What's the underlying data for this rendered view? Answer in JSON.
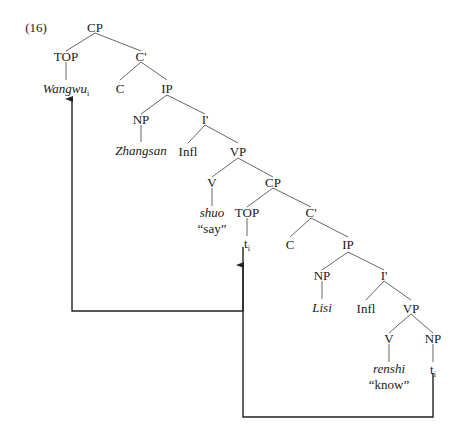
{
  "figure": {
    "example_number": "(16)",
    "stroke_color": "#555555",
    "text_color": "#1a1a1a",
    "arrow_color": "#222222",
    "background": "#ffffff"
  },
  "nodes": {
    "cp_matrix": "CP",
    "top_matrix": "TOP",
    "cbar_matrix": "C'",
    "wangwu": "Wangwu",
    "wangwu_index": "i",
    "c_matrix": "C",
    "ip_matrix": "IP",
    "np_matrix": "NP",
    "ibar_matrix": "I'",
    "zhangsan": "Zhangsan",
    "infl_matrix": "Infl",
    "vp_matrix": "VP",
    "v_matrix": "V",
    "shuo": "shuo",
    "shuo_gloss": "“say”",
    "cp_embedded": "CP",
    "top_embedded": "TOP",
    "cbar_embedded": "C'",
    "trace_top": "t",
    "trace_top_index": "i",
    "c_embedded": "C",
    "ip_embedded": "IP",
    "np_embedded": "NP",
    "ibar_embedded": "I'",
    "lisi": "Lisi",
    "infl_embedded": "Infl",
    "vp_embedded": "VP",
    "v_embedded": "V",
    "renshi": "renshi",
    "renshi_gloss": "“know”",
    "np_object": "NP",
    "trace_object": "t",
    "trace_object_index": "i"
  },
  "movement": {
    "arrow_1_label": "movement from embedded TOP to matrix TOP",
    "arrow_2_label": "movement from object position to embedded TOP"
  }
}
